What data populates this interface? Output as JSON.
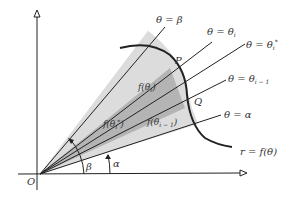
{
  "diagram": {
    "origin_label": "O",
    "angles": {
      "beta": "β",
      "alpha": "α"
    },
    "rays": [
      {
        "id": "beta",
        "label": "θ = β"
      },
      {
        "id": "theta_i",
        "label": "θ = θ",
        "sub": "i"
      },
      {
        "id": "theta_i_star",
        "label": "θ = θ",
        "sub": "i",
        "sup": "*"
      },
      {
        "id": "theta_i_minus_1",
        "label": "θ = θ",
        "sub": "i − 1"
      },
      {
        "id": "alpha",
        "label": "θ = α"
      }
    ],
    "points": {
      "P": "P",
      "Q": "Q"
    },
    "region_labels": {
      "f_theta_i": "f(θ",
      "f_theta_i_sub": "i",
      "f_theta_i_close": ")",
      "f_theta_star": "f(θ",
      "f_theta_star_sub": "i",
      "f_theta_star_sup": "*",
      "f_theta_star_close": ")",
      "f_theta_im1": "f(θ",
      "f_theta_im1_sub": "i − 1",
      "f_theta_im1_close": ")"
    },
    "curve_label": "r = f(θ)",
    "colors": {
      "light_shade": "#dcdcdc",
      "dark_shade": "#b4b4b4",
      "line": "#222222"
    }
  }
}
